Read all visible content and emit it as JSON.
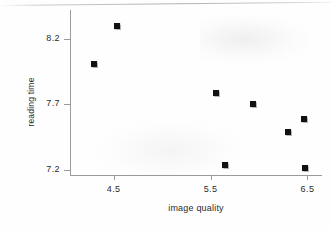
{
  "chart_data": {
    "type": "scatter",
    "title": "",
    "xlabel": "image quality",
    "ylabel": "reading time",
    "xlim": [
      4.05,
      6.65
    ],
    "ylim": [
      7.16,
      8.42
    ],
    "xticks": [
      4.5,
      5.5,
      6.5
    ],
    "xtick_labels": [
      "4.5",
      "5.5",
      "6.5"
    ],
    "yticks": [
      7.2,
      7.7,
      8.2
    ],
    "ytick_labels": [
      "7.2",
      "7.7",
      "8.2"
    ],
    "grid": false,
    "legend": null,
    "marker": "square",
    "marker_color": "#111114",
    "points": [
      {
        "x": 4.3,
        "y": 8.01
      },
      {
        "x": 4.54,
        "y": 8.3
      },
      {
        "x": 5.56,
        "y": 7.79
      },
      {
        "x": 5.65,
        "y": 7.24
      },
      {
        "x": 5.94,
        "y": 7.7
      },
      {
        "x": 6.3,
        "y": 7.49
      },
      {
        "x": 6.46,
        "y": 7.59
      },
      {
        "x": 6.47,
        "y": 7.21
      }
    ]
  },
  "axes": {
    "x_title": "image quality",
    "y_title": "reading time",
    "x_tick_labels": [
      "4.5",
      "5.5",
      "6.5"
    ],
    "y_tick_labels": [
      "7.2",
      "7.7",
      "8.2"
    ]
  },
  "style": {
    "axis_color": "#9a9a9e",
    "text_color": "#2b2b2b",
    "point_color": "#111114",
    "background": "#fefefe"
  }
}
